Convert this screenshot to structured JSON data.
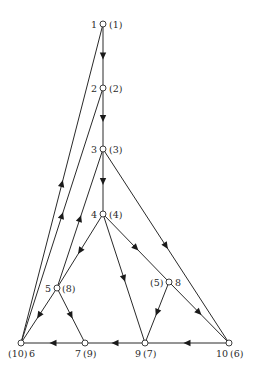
{
  "diagram": {
    "type": "directed-graph",
    "nodes": [
      {
        "id": "1",
        "x": 103,
        "y": 24,
        "label": "1",
        "alt_label": "(1)",
        "label_text": "1 ○ (1)"
      },
      {
        "id": "2",
        "x": 103,
        "y": 88,
        "label": "2",
        "alt_label": "(2)"
      },
      {
        "id": "3",
        "x": 103,
        "y": 149,
        "label": "3",
        "alt_label": "(3)"
      },
      {
        "id": "4",
        "x": 103,
        "y": 214,
        "label": "4",
        "alt_label": "(4)"
      },
      {
        "id": "5",
        "x": 57,
        "y": 288,
        "label": "5",
        "alt_label": "(8)"
      },
      {
        "id": "8",
        "x": 169,
        "y": 282,
        "label": "8",
        "alt_label": "(5)"
      },
      {
        "id": "6",
        "x": 21,
        "y": 343,
        "label": "6",
        "alt_label": "(10)"
      },
      {
        "id": "7",
        "x": 85,
        "y": 343,
        "label": "7",
        "alt_label": "(9)"
      },
      {
        "id": "9",
        "x": 145,
        "y": 343,
        "label": "9",
        "alt_label": "(7)"
      },
      {
        "id": "10",
        "x": 229,
        "y": 343,
        "label": "10",
        "alt_label": "(6)"
      }
    ],
    "edges": [
      {
        "from": "1",
        "to": "2"
      },
      {
        "from": "2",
        "to": "3"
      },
      {
        "from": "3",
        "to": "4"
      },
      {
        "from": "3",
        "to": "10"
      },
      {
        "from": "4",
        "to": "5"
      },
      {
        "from": "4",
        "to": "9"
      },
      {
        "from": "4",
        "to": "8"
      },
      {
        "from": "8",
        "to": "10"
      },
      {
        "from": "8",
        "to": "9"
      },
      {
        "from": "5",
        "to": "6"
      },
      {
        "from": "5",
        "to": "7"
      },
      {
        "from": "5",
        "to": "3"
      },
      {
        "from": "6",
        "to": "1"
      },
      {
        "from": "6",
        "to": "2"
      },
      {
        "from": "7",
        "to": "6"
      },
      {
        "from": "9",
        "to": "7"
      },
      {
        "from": "10",
        "to": "9"
      }
    ],
    "labels": {
      "n1": "1",
      "n1_alt": "(1)",
      "n2": "2",
      "n2_alt": "(2)",
      "n3": "3",
      "n3_alt": "(3)",
      "n4": "4",
      "n4_alt": "(4)",
      "n5": "5",
      "n5_alt": "(8)",
      "n8": "8",
      "n8_alt": "(5)",
      "n6": "6",
      "n6_alt": "(10)",
      "n7": "7",
      "n7_alt": "(9)",
      "n9": "9",
      "n9_alt": "(7)",
      "n10": "10",
      "n10_alt": "(6)"
    }
  }
}
